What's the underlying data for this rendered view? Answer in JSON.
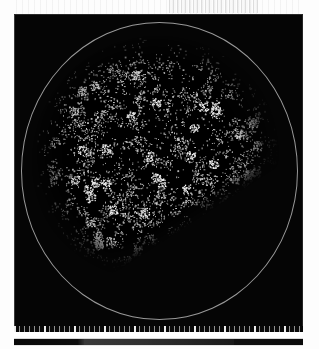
{
  "figure": {
    "title": "",
    "panel_label": "",
    "background_color": "#050505",
    "boundary_color": "#b9b9b9",
    "point_color": "#ffffff"
  },
  "plot": {
    "name": "large-scale-structure-map",
    "region_outline": "circle",
    "survey_cut_edge": "diagonal",
    "axis": {
      "tick_count": 58,
      "major_tick_count": 10,
      "tick_color": "#d0d0d0"
    }
  },
  "colorbar": {
    "label": "",
    "min_label": "",
    "max_label": "",
    "gradient_from": "#080808",
    "gradient_to": "#3a3a3a"
  },
  "chart_data": {
    "type": "scatter",
    "title": "",
    "xlabel": "",
    "ylabel": "",
    "grid": false,
    "legend": null,
    "projection": "circular-sky-projection",
    "field": {
      "center_x": 0.5,
      "center_y": 0.47,
      "outer_radius_px": 139,
      "blob_radius_px": 126,
      "cut_angle_deg": -33
    },
    "xlim": [
      0,
      1
    ],
    "ylim": [
      0,
      1
    ],
    "n_points": 4200,
    "point_size_px": 1,
    "intensity_range": [
      0,
      255
    ]
  }
}
